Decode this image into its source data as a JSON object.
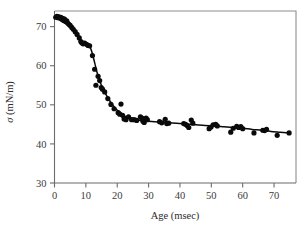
{
  "chart_data": {
    "type": "scatter",
    "title": "",
    "subtitle": "",
    "xlabel": "Age (msec)",
    "ylabel": "σ (mN/m)",
    "ylabel_symbol": "σ",
    "ylabel_units": " (mN/m)",
    "xlim": [
      0,
      77
    ],
    "ylim": [
      30,
      74
    ],
    "xticks": [
      0,
      10,
      20,
      30,
      40,
      50,
      60,
      70
    ],
    "xtick_labels": [
      "0",
      "10",
      "20",
      "30",
      "40",
      "50",
      "60",
      "70"
    ],
    "yticks": [
      30,
      40,
      50,
      60,
      70
    ],
    "ytick_labels": [
      "30",
      "40",
      "50",
      "60",
      "70"
    ],
    "grid": false,
    "legend": null,
    "marker_color": "#0a0a0a",
    "curve_color": "#0a0a0a",
    "axis_color": "#6b6b6b",
    "frame_color": "#8d8d8d",
    "series": [
      {
        "name": "surface tension vs surface age",
        "marker": "filled-circle",
        "points": [
          [
            0.4,
            72.4
          ],
          [
            0.8,
            72.6
          ],
          [
            1.1,
            72.3
          ],
          [
            1.4,
            72.5
          ],
          [
            1.7,
            72.2
          ],
          [
            2.0,
            72.4
          ],
          [
            2.3,
            71.9
          ],
          [
            2.6,
            72.1
          ],
          [
            2.9,
            71.6
          ],
          [
            3.2,
            71.9
          ],
          [
            3.5,
            71.3
          ],
          [
            3.9,
            71.5
          ],
          [
            4.2,
            70.9
          ],
          [
            4.6,
            70.6
          ],
          [
            5.0,
            70.3
          ],
          [
            5.5,
            69.8
          ],
          [
            6.0,
            69.3
          ],
          [
            6.6,
            68.7
          ],
          [
            7.2,
            68.0
          ],
          [
            7.9,
            67.1
          ],
          [
            8.4,
            66.2
          ],
          [
            8.7,
            65.9
          ],
          [
            9.1,
            65.6
          ],
          [
            9.6,
            65.8
          ],
          [
            10.2,
            65.5
          ],
          [
            10.7,
            65.2
          ],
          [
            11.2,
            65.1
          ],
          [
            12.1,
            62.6
          ],
          [
            12.8,
            59.1
          ],
          [
            13.2,
            55.0
          ],
          [
            13.9,
            57.3
          ],
          [
            14.4,
            56.2
          ],
          [
            14.9,
            54.4
          ],
          [
            15.3,
            54.0
          ],
          [
            16.0,
            53.3
          ],
          [
            17.0,
            51.6
          ],
          [
            18.0,
            50.1
          ],
          [
            19.0,
            49.0
          ],
          [
            20.3,
            48.0
          ],
          [
            20.8,
            47.6
          ],
          [
            21.2,
            50.2
          ],
          [
            21.7,
            47.3
          ],
          [
            22.2,
            46.4
          ],
          [
            22.8,
            46.2
          ],
          [
            23.6,
            46.9
          ],
          [
            24.6,
            46.2
          ],
          [
            25.4,
            46.2
          ],
          [
            26.2,
            46.0
          ],
          [
            27.4,
            46.9
          ],
          [
            27.9,
            46.6
          ],
          [
            28.2,
            45.8
          ],
          [
            28.6,
            45.5
          ],
          [
            29.2,
            46.6
          ],
          [
            29.6,
            46.2
          ],
          [
            33.5,
            45.7
          ],
          [
            34.2,
            45.4
          ],
          [
            35.3,
            46.3
          ],
          [
            35.8,
            45.2
          ],
          [
            36.4,
            45.3
          ],
          [
            41.2,
            45.2
          ],
          [
            41.8,
            45.0
          ],
          [
            42.3,
            44.7
          ],
          [
            42.8,
            44.2
          ],
          [
            43.6,
            46.1
          ],
          [
            44.1,
            45.3
          ],
          [
            49.3,
            43.9
          ],
          [
            49.9,
            44.3
          ],
          [
            50.6,
            44.9
          ],
          [
            51.4,
            45.0
          ],
          [
            51.9,
            44.6
          ],
          [
            56.2,
            43.0
          ],
          [
            57.0,
            44.0
          ],
          [
            58.1,
            44.5
          ],
          [
            58.7,
            44.2
          ],
          [
            59.4,
            44.4
          ],
          [
            60.0,
            43.9
          ],
          [
            63.6,
            42.8
          ],
          [
            66.4,
            43.5
          ],
          [
            67.0,
            43.4
          ],
          [
            67.6,
            43.7
          ],
          [
            71.0,
            42.2
          ],
          [
            74.8,
            42.8
          ]
        ]
      }
    ],
    "fit_curve": {
      "name": "smoothed fit",
      "points": [
        [
          0.3,
          72.5
        ],
        [
          1.5,
          72.3
        ],
        [
          3.0,
          71.8
        ],
        [
          4.5,
          70.9
        ],
        [
          6.0,
          69.6
        ],
        [
          7.5,
          67.8
        ],
        [
          8.6,
          66.3
        ],
        [
          9.5,
          65.7
        ],
        [
          10.5,
          65.3
        ],
        [
          11.3,
          64.8
        ],
        [
          12.0,
          63.3
        ],
        [
          12.8,
          60.8
        ],
        [
          13.6,
          58.2
        ],
        [
          14.4,
          56.2
        ],
        [
          15.2,
          54.5
        ],
        [
          16.2,
          52.9
        ],
        [
          17.4,
          51.3
        ],
        [
          18.6,
          49.9
        ],
        [
          19.8,
          48.8
        ],
        [
          21.0,
          48.0
        ],
        [
          22.2,
          47.2
        ],
        [
          23.5,
          46.7
        ],
        [
          25.0,
          46.3
        ],
        [
          26.5,
          46.1
        ],
        [
          28.0,
          45.9
        ],
        [
          30.0,
          45.8
        ],
        [
          33.0,
          45.6
        ],
        [
          36.0,
          45.4
        ],
        [
          39.0,
          45.3
        ],
        [
          42.0,
          45.1
        ],
        [
          45.0,
          44.9
        ],
        [
          48.0,
          44.7
        ],
        [
          51.0,
          44.6
        ],
        [
          54.0,
          44.4
        ],
        [
          57.0,
          44.2
        ],
        [
          60.0,
          44.0
        ],
        [
          63.0,
          43.7
        ],
        [
          66.0,
          43.5
        ],
        [
          69.0,
          43.2
        ],
        [
          72.0,
          43.0
        ],
        [
          74.8,
          42.8
        ]
      ]
    }
  },
  "figure": {
    "background_color": "#ffffff",
    "caption": ""
  }
}
